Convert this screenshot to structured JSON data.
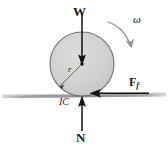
{
  "figure": {
    "background_color": "#ffffff",
    "body": {
      "name": "disk",
      "shape": "circle",
      "center_x": 82,
      "center_y": 64,
      "radius": 32,
      "fill_color": "#cfcfcf",
      "stroke_color": "#6e6e6e",
      "center_dot_color": "#1a1a1a"
    },
    "ground": {
      "name": "ground-surface",
      "y": 96,
      "x_start": 2,
      "x_end": 166,
      "color": "#a8a8a8"
    },
    "contact_point": {
      "x": 82,
      "y": 96
    }
  },
  "labels": {
    "weight": "W",
    "normal": "N",
    "angular_velocity": "ω",
    "friction_base": "F",
    "friction_subscript": "f",
    "instant_center": "IC",
    "radius": "r"
  },
  "vectors": [
    {
      "name": "weight-vector",
      "label": "W",
      "direction": "down",
      "from_x": 82,
      "from_y": 12,
      "to_x": 82,
      "to_y": 64,
      "color": "#111111"
    },
    {
      "name": "normal-force-vector",
      "label": "N",
      "direction": "up",
      "from_x": 82,
      "from_y": 131,
      "to_x": 82,
      "to_y": 97,
      "color": "#111111"
    },
    {
      "name": "friction-force-vector",
      "label": "Ff",
      "direction": "left",
      "from_x": 148,
      "from_y": 93,
      "to_x": 90,
      "to_y": 93,
      "color": "#111111"
    },
    {
      "name": "angular-velocity-arc",
      "label": "ω",
      "direction": "clockwise",
      "color": "#8c8c8c"
    },
    {
      "name": "radius-line",
      "label": "r",
      "from_x": 82,
      "from_y": 64,
      "to_x": 59,
      "to_y": 87,
      "color": "#6e6e6e"
    }
  ]
}
